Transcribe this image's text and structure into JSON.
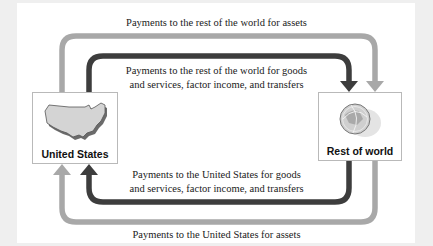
{
  "diagram": {
    "type": "circular-flow",
    "colors": {
      "asset_flow": "#a8a8a8",
      "goods_flow": "#3d3d3d",
      "background": "#efefef",
      "panel": "#ffffff",
      "node_border": "#b9b9b9"
    },
    "nodes": {
      "us": {
        "label": "United States",
        "icon": "us-map-icon"
      },
      "row": {
        "label": "Rest of world",
        "icon": "globe-icon"
      }
    },
    "flows": {
      "top_outer": {
        "label": "Payments to the rest of the world for assets",
        "from": "United States",
        "to": "Rest of world"
      },
      "top_inner": {
        "line1": "Payments to the rest of the world for goods",
        "line2": "and services, factor income, and transfers",
        "from": "United States",
        "to": "Rest of world"
      },
      "bottom_inner": {
        "line1": "Payments to the United States for goods",
        "line2": "and services, factor income, and transfers",
        "from": "Rest of world",
        "to": "United States"
      },
      "bottom_outer": {
        "label": "Payments to the United States for assets",
        "from": "Rest of world",
        "to": "United States"
      }
    }
  }
}
